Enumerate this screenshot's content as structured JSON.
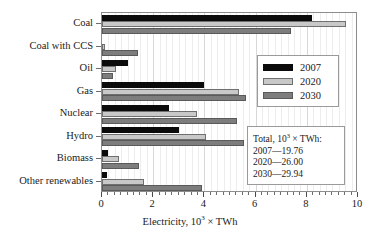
{
  "chart_data": {
    "type": "bar",
    "orientation": "horizontal",
    "title": "",
    "xlabel": "Electricity, 10^3 x TWh",
    "xlabel_parts": {
      "prefix": "Electricity, 10",
      "sup": "3",
      "suffix": " × TWh"
    },
    "ylabel": "",
    "xlim": [
      0,
      10
    ],
    "xticks": [
      0,
      2,
      4,
      6,
      8,
      10
    ],
    "xticklabels": [
      "0",
      "2",
      "4",
      "6",
      "8",
      "10"
    ],
    "minor_tick_step": 0.25,
    "grid": true,
    "legend_position": "upper right",
    "categories": [
      "Coal",
      "Coal with CCS",
      "Oil",
      "Gas",
      "Nuclear",
      "Hydro",
      "Biomass",
      "Other renewables"
    ],
    "series": [
      {
        "name": "2007",
        "color": "#0b0b0b",
        "values": [
          8.22,
          0.0,
          1.02,
          4.0,
          2.6,
          3.0,
          0.25,
          0.2
        ]
      },
      {
        "name": "2020",
        "color": "#c8c8c8",
        "values": [
          9.55,
          0.1,
          0.55,
          5.35,
          3.72,
          4.08,
          0.65,
          1.65
        ]
      },
      {
        "name": "2030",
        "color": "#7d7d7d",
        "values": [
          7.4,
          1.42,
          0.43,
          5.62,
          5.28,
          5.55,
          1.45,
          3.9
        ]
      }
    ],
    "annotations": {
      "totals_box": {
        "header_parts": {
          "prefix": "Total, 10",
          "sup": "3",
          "suffix": " × TWh:"
        },
        "header": "Total, 10^3 x TWh:",
        "lines": [
          "2007—19.76",
          "2020—26.00",
          "2030—29.94"
        ]
      }
    }
  },
  "legend": {
    "entries": [
      {
        "label": "2007"
      },
      {
        "label": "2020"
      },
      {
        "label": "2030"
      }
    ]
  }
}
